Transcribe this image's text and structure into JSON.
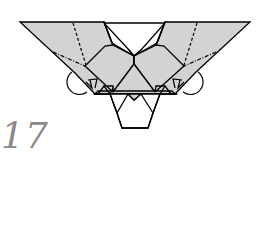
{
  "diagram": {
    "type": "origami-instruction-step",
    "step_number": "17",
    "colors": {
      "paper": "#d3d3d3",
      "line": "#000000",
      "background": "#ffffff",
      "step_number": "#8a8a8a"
    },
    "elements": {
      "left_wing": {
        "fold_lines": [
          "valley-fold",
          "mountain-fold"
        ],
        "arrow": "rotate-fold-arrow"
      },
      "right_wing": {
        "fold_lines": [
          "valley-fold",
          "mountain-fold"
        ],
        "arrow": "rotate-fold-arrow"
      },
      "center": "triangular-flap",
      "bottom": "hexagonal-head-flap"
    }
  }
}
